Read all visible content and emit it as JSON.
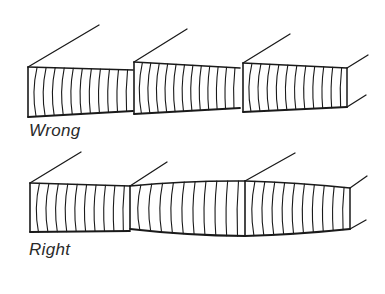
{
  "diagram": {
    "panels": [
      {
        "id": "wrong",
        "label": "Wrong",
        "blocks": [
          {
            "x0": 28,
            "x1": 133,
            "top0": 67,
            "top1": 70,
            "bot0": 117,
            "bot1": 111,
            "diag": [
              28,
              67,
              99,
              25
            ],
            "rings": 11
          },
          {
            "x0": 134,
            "x1": 240,
            "top0": 62,
            "top1": 68,
            "bot0": 114,
            "bot1": 108,
            "diag": [
              134,
              62,
              187,
              29
            ],
            "rings": 12
          },
          {
            "x0": 243,
            "x1": 347,
            "top0": 63,
            "top1": 68,
            "bot0": 112,
            "bot1": 107,
            "diag": [
              243,
              63,
              290,
              34
            ],
            "rings": 11
          }
        ],
        "end_lines": [
          [
            347,
            68,
            368,
            55
          ],
          [
            347,
            107,
            366,
            95
          ]
        ],
        "label_pos": [
          29,
          121
        ]
      },
      {
        "id": "right",
        "label": "Right",
        "blocks": [
          {
            "x0": 30,
            "x1": 130,
            "top0": 183,
            "top1": 186,
            "bot0": 232,
            "bot1": 231,
            "diag": [
              30,
              183,
              81,
              152
            ],
            "rings": 10,
            "bulge": 0
          },
          {
            "x0": 130,
            "x1": 245,
            "top0": 186,
            "top1": 181,
            "bot0": 229,
            "bot1": 236,
            "diag": [
              130,
              186,
              167,
              162
            ],
            "rings": 10,
            "bulge": 3
          },
          {
            "x0": 245,
            "x1": 350,
            "top0": 181,
            "top1": 188,
            "bot0": 236,
            "bot1": 229,
            "diag": [
              245,
              181,
              295,
              153
            ],
            "rings": 10,
            "bulge": 2
          }
        ],
        "end_lines": [
          [
            350,
            188,
            367,
            176
          ],
          [
            350,
            229,
            366,
            220
          ]
        ],
        "label_pos": [
          29,
          240
        ]
      }
    ],
    "colors": {
      "ink": "#1a1a1a",
      "background": "#ffffff",
      "label": "#2a2a2a"
    }
  }
}
